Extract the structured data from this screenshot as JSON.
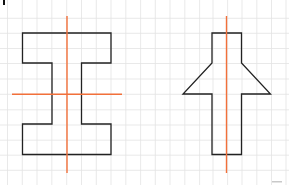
{
  "figure": {
    "width": 289,
    "height": 185,
    "background": "#ffffff",
    "grid": {
      "color": "#e3e3e3",
      "x_lines": [
        7.5,
        22.3,
        37.0,
        51.8,
        66.7,
        81.5,
        96.3,
        111.0,
        125.8,
        140.6,
        155.3,
        170.0,
        184.8,
        199.6,
        213.0,
        227.6,
        242.0,
        256.8,
        271.5,
        286.0
      ],
      "y_lines": [
        18.3,
        33.3,
        48.5,
        63.5,
        79.0,
        94.3,
        109.8,
        125.0,
        140.2,
        155.2,
        170.3
      ]
    },
    "shapes": [
      {
        "name": "i-beam-shape",
        "stroke": "#222222",
        "points": [
          [
            22.5,
            33
          ],
          [
            111,
            33
          ],
          [
            111,
            63
          ],
          [
            81.5,
            63
          ],
          [
            81.5,
            124
          ],
          [
            111,
            124
          ],
          [
            111,
            154.5
          ],
          [
            22.5,
            154.5
          ],
          [
            22.5,
            124
          ],
          [
            52,
            124
          ],
          [
            52,
            63
          ],
          [
            22.5,
            63
          ]
        ]
      },
      {
        "name": "arrow-shape",
        "stroke": "#222222",
        "points": [
          [
            212,
            33
          ],
          [
            241.5,
            33
          ],
          [
            241.5,
            63
          ],
          [
            270.5,
            94
          ],
          [
            241.5,
            94
          ],
          [
            241.5,
            154.5
          ],
          [
            212,
            154.5
          ],
          [
            212,
            94
          ],
          [
            183,
            94
          ],
          [
            212,
            63
          ]
        ]
      }
    ],
    "symmetry_lines": [
      {
        "name": "i-beam-vertical-axis",
        "color": "#f2703a",
        "x1": 67,
        "y1": 16,
        "x2": 67,
        "y2": 173
      },
      {
        "name": "i-beam-horizontal-axis",
        "color": "#f2703a",
        "x1": 12,
        "y1": 94.3,
        "x2": 122,
        "y2": 94.3
      },
      {
        "name": "arrow-vertical-axis",
        "color": "#f2703a",
        "x1": 226.5,
        "y1": 16,
        "x2": 226.5,
        "y2": 173
      }
    ],
    "artifacts": [
      {
        "name": "corner-mark",
        "color": "#111111",
        "x": 3,
        "y": 0,
        "w": 2,
        "h": 5
      },
      {
        "name": "faint-mark",
        "color": "#c9c9c9",
        "x": 272,
        "y": 181,
        "w": 10,
        "h": 1.5
      }
    ]
  }
}
